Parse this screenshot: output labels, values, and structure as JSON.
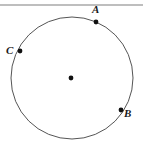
{
  "figure": {
    "canvas": {
      "width": 143,
      "height": 148,
      "background": "#ffffff"
    },
    "top_rule": {
      "name": "top-horizontal-rule",
      "x1": 0,
      "y1": 5,
      "x2": 143,
      "y2": 5,
      "color": "#a8a8a8",
      "stroke_width": 1.4
    },
    "circle": {
      "name": "main-circle",
      "cx": 72,
      "cy": 78,
      "r": 61,
      "stroke_color": "#555555",
      "stroke_width": 1,
      "fill": "none"
    },
    "center_point": {
      "name": "circle-center-dot",
      "cx": 71,
      "cy": 78,
      "r": 2.4,
      "color": "#111111"
    },
    "points": [
      {
        "id": "A",
        "label": "A",
        "name": "point-a",
        "cx": 96,
        "cy": 22,
        "r": 2.4,
        "color": "#111111",
        "label_x": 92,
        "label_y": 4
      },
      {
        "id": "C",
        "label": "C",
        "name": "point-c",
        "cx": 20,
        "cy": 51,
        "r": 2.4,
        "color": "#111111",
        "label_x": 6,
        "label_y": 45
      },
      {
        "id": "B",
        "label": "B",
        "name": "point-b",
        "cx": 121,
        "cy": 110,
        "r": 2.4,
        "color": "#111111",
        "label_x": 124,
        "label_y": 108
      }
    ]
  }
}
